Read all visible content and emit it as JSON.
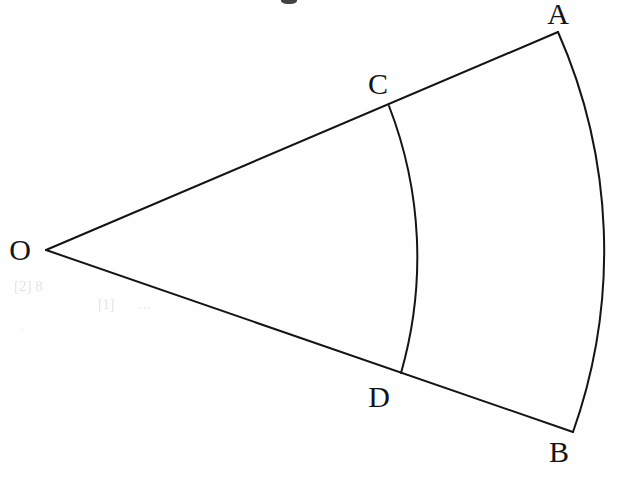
{
  "figure": {
    "kind": "circular-sector-diagram",
    "background_color": "#fefefe",
    "stroke_color": "#141414",
    "stroke_width": 2,
    "canvas": {
      "width": 621,
      "height": 489
    },
    "points": {
      "O": {
        "x": 46,
        "y": 250
      },
      "A": {
        "x": 558,
        "y": 32
      },
      "B": {
        "x": 573,
        "y": 432
      },
      "C": {
        "x": 389,
        "y": 106
      },
      "D": {
        "x": 401,
        "y": 373
      }
    },
    "labels": [
      {
        "id": "O",
        "text": "O",
        "x": 20,
        "y": 250
      },
      {
        "id": "A",
        "text": "A",
        "x": 558,
        "y": 14
      },
      {
        "id": "B",
        "text": "B",
        "x": 559,
        "y": 452
      },
      {
        "id": "C",
        "text": "C",
        "x": 378,
        "y": 84
      },
      {
        "id": "D",
        "text": "D",
        "x": 379,
        "y": 397
      }
    ],
    "segments": [
      {
        "id": "OA",
        "from": "O",
        "to": "A"
      },
      {
        "id": "OB",
        "from": "O",
        "to": "B"
      }
    ],
    "arcs": [
      {
        "id": "AB",
        "from": "A",
        "to": "B",
        "kind": "outer-arc",
        "bulge_x": 604,
        "bulge_y": 237
      },
      {
        "id": "CD",
        "from": "C",
        "to": "D",
        "kind": "inner-arc",
        "bulge_x": 417,
        "bulge_y": 241
      }
    ],
    "artifacts": {
      "bleed_through": [
        {
          "id": "bleed-1",
          "text": "[2] 8",
          "x": 14,
          "y": 278,
          "size": 15
        },
        {
          "id": "bleed-2",
          "text": "[1]",
          "x": 98,
          "y": 297,
          "size": 14
        },
        {
          "id": "bleed-3",
          "text": "···",
          "x": 138,
          "y": 300,
          "size": 13
        },
        {
          "id": "bleed-4",
          "text": "·",
          "x": 20,
          "y": 322,
          "size": 12
        }
      ],
      "top_smudge": {
        "x": 281,
        "y": -4,
        "width": 16,
        "height": 8
      }
    }
  }
}
